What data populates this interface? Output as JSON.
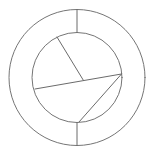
{
  "figure": {
    "background_color": "#ffffff",
    "stroke_color": "#6f6f6f",
    "stroke_width": 1,
    "canvas": {
      "width": 154,
      "height": 155
    },
    "outer_circle": {
      "label": "outer-circle",
      "center_x": 77,
      "center_y": 77.5,
      "radius": 68
    },
    "inner_circle": {
      "label": "inner-circle",
      "center_x": 77,
      "center_y": 77.5,
      "radius": 45
    },
    "spokes": [
      {
        "label": "top-spoke",
        "x1": 77,
        "y1": 9.5,
        "x2": 77,
        "y2": 32.5
      },
      {
        "label": "bottom-spoke",
        "x1": 77,
        "y1": 122.5,
        "x2": 77,
        "y2": 145.5
      }
    ],
    "chords": [
      {
        "label": "upper-left-chord",
        "x1": 57,
        "y1": 37,
        "x2": 83.5,
        "y2": 80.5
      },
      {
        "label": "horizontal-chord",
        "x1": 35,
        "y1": 89,
        "x2": 121.5,
        "y2": 74
      },
      {
        "label": "lower-right-chord",
        "x1": 121.5,
        "y1": 74,
        "x2": 79,
        "y2": 122
      }
    ],
    "vertices": [
      {
        "label": "inner-vertex",
        "x": 83.5,
        "y": 80.5
      },
      {
        "label": "right-rim-vertex",
        "x": 121.5,
        "y": 74
      }
    ]
  }
}
